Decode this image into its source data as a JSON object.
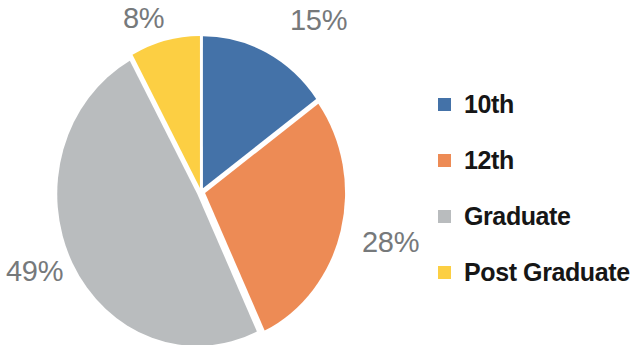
{
  "chart_data": {
    "type": "pie",
    "title": "",
    "subtitle": "",
    "xlabel": "",
    "ylabel": "",
    "grid": false,
    "legend_position": "right",
    "categories": [
      "10th",
      "12th",
      "Graduate",
      "Post Graduate"
    ],
    "values": [
      15,
      28,
      49,
      8
    ],
    "value_unit": "%",
    "data_labels": [
      "15%",
      "28%",
      "49%",
      "8%"
    ],
    "colors": [
      "#4472a8",
      "#ed8b55",
      "#b9bcbe",
      "#fccf43"
    ],
    "start_angle_deg": 0,
    "direction": "clockwise",
    "exploded": true,
    "slices": [
      {
        "name": "10th",
        "value": 15,
        "label": "15%",
        "color": "#4472a8",
        "start_deg": 0,
        "end_deg": 54
      },
      {
        "name": "12th",
        "value": 28,
        "label": "28%",
        "color": "#ed8b55",
        "start_deg": 54,
        "end_deg": 155
      },
      {
        "name": "Graduate",
        "value": 49,
        "label": "49%",
        "color": "#b9bcbe",
        "start_deg": 155,
        "end_deg": 331
      },
      {
        "name": "Post Graduate",
        "value": 8,
        "label": "8%",
        "color": "#fccf43",
        "start_deg": 331,
        "end_deg": 360
      }
    ]
  },
  "labels": {
    "blue": "15%",
    "orange": "28%",
    "gray": "49%",
    "yellow": "8%"
  },
  "legend": {
    "items": [
      {
        "label": "10th",
        "color": "#4472a8"
      },
      {
        "label": "12th",
        "color": "#ed8b55"
      },
      {
        "label": "Graduate",
        "color": "#b9bcbe"
      },
      {
        "label": "Post Graduate",
        "color": "#fccf43"
      }
    ]
  },
  "style": {
    "background": "#ffffff",
    "label_color": "#76797b",
    "legend_text_color": "#161616",
    "slice_gap_color": "#ffffff"
  }
}
